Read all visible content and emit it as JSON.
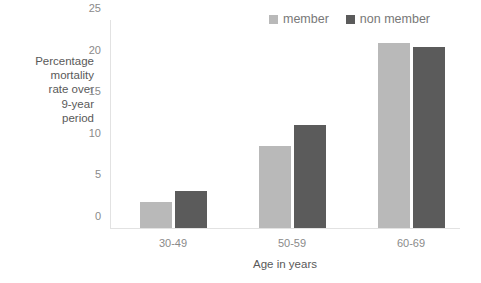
{
  "chart_data": {
    "type": "bar",
    "title": "",
    "categories": [
      "30-49",
      "50-59",
      "60-69"
    ],
    "series": [
      {
        "name": "member",
        "color": "#b9b9b9",
        "values": [
          3.1,
          9.9,
          22.2
        ]
      },
      {
        "name": "non member",
        "color": "#5b5b5b",
        "values": [
          4.4,
          12.4,
          21.8
        ]
      }
    ],
    "xlabel": "Age in years",
    "ylabel": "Percentage mortality rate over 9-year period",
    "ylabel_lines": "Percentage\nmortality\nrate over\n9-year\nperiod",
    "ylim": [
      0,
      25
    ],
    "yticks": [
      0,
      5,
      10,
      15,
      20,
      25
    ],
    "ytick_labels": [
      "0",
      "5",
      "10",
      "15",
      "20",
      "25"
    ],
    "grid": false,
    "legend_position": "top-right"
  },
  "legend": {
    "entries": [
      {
        "label": "member",
        "color": "#b9b9b9"
      },
      {
        "label": "non member",
        "color": "#5b5b5b"
      }
    ]
  },
  "axes": {
    "x_title": "Age in years",
    "y_title": "Percentage\nmortality\nrate over\n9-year\nperiod",
    "y_ticks": [
      "0",
      "5",
      "10",
      "15",
      "20",
      "25"
    ],
    "x_categories": [
      "30-49",
      "50-59",
      "60-69"
    ]
  },
  "colors": {
    "member": "#b9b9b9",
    "non_member": "#5b5b5b",
    "axis": "#e2e2e2",
    "text": "#7d7d7d",
    "background": "#ffffff"
  }
}
